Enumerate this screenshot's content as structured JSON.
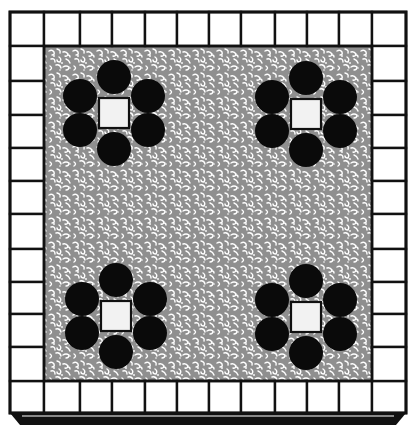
{
  "diagram": {
    "colors": {
      "background": "#ffffff",
      "line": "#111111",
      "tile_fill": "#ffffff",
      "field_gray": "#8f8f8f",
      "field_speckle": "#ffffff",
      "circle_fill": "#0a0a0a",
      "center_square_fill": "#f2f2f2"
    },
    "border": {
      "columns_x": [
        10,
        44,
        80,
        112,
        145,
        177,
        209,
        241,
        275,
        307,
        339,
        372,
        406
      ],
      "rows_y": [
        12,
        46,
        81,
        115,
        148,
        181,
        214,
        249,
        282,
        314,
        347,
        381,
        413
      ],
      "tiles_per_side": 12
    },
    "field": {
      "x": 44,
      "y": 46,
      "width": 328,
      "height": 335
    },
    "clusters": [
      {
        "name": "top-left",
        "cx": 114,
        "cy": 113
      },
      {
        "name": "top-right",
        "cx": 306,
        "cy": 114
      },
      {
        "name": "bottom-left",
        "cx": 116,
        "cy": 316
      },
      {
        "name": "bottom-right",
        "cx": 306,
        "cy": 317
      }
    ],
    "cluster_shape": {
      "center_square_size": 30,
      "circle_radius": 17,
      "circle_offsets": [
        [
          0,
          -36
        ],
        [
          34,
          -17
        ],
        [
          34,
          17
        ],
        [
          0,
          36
        ],
        [
          -34,
          17
        ],
        [
          -34,
          -17
        ]
      ]
    }
  }
}
